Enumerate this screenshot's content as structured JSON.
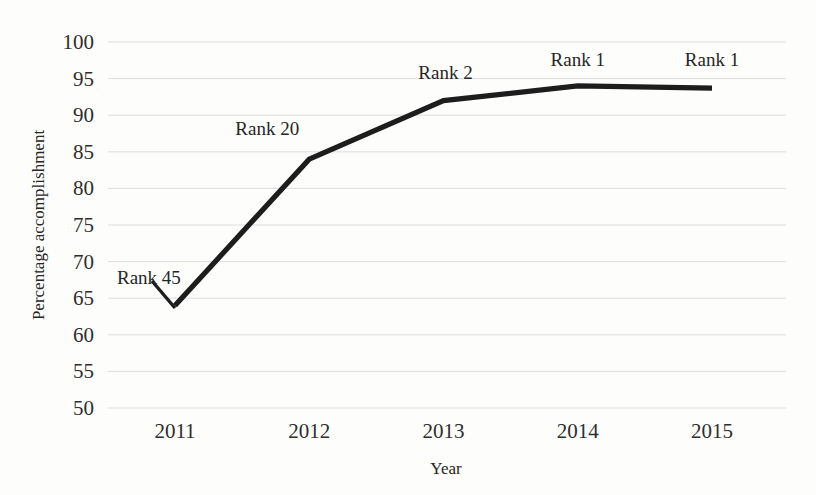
{
  "chart_data": {
    "type": "line",
    "title": "",
    "xlabel": "Year",
    "ylabel": "Percentage accomplishment",
    "categories": [
      "2011",
      "2012",
      "2013",
      "2014",
      "2015"
    ],
    "values": [
      64,
      84,
      92,
      94,
      93.7
    ],
    "series": [
      {
        "name": "Percentage accomplishment",
        "values": [
          64,
          84,
          92,
          94,
          93.7
        ],
        "color": "#1d1d1d"
      }
    ],
    "annotations": [
      {
        "label": "Rank 45",
        "category": "2011",
        "value": 64
      },
      {
        "label": "Rank 20",
        "category": "2012",
        "value": 84
      },
      {
        "label": "Rank 2",
        "category": "2013",
        "value": 92
      },
      {
        "label": "Rank 1",
        "category": "2014",
        "value": 94
      },
      {
        "label": "Rank 1",
        "category": "2015",
        "value": 93.7
      }
    ],
    "yticks": [
      "50",
      "55",
      "60",
      "65",
      "70",
      "75",
      "80",
      "85",
      "90",
      "95",
      "100"
    ],
    "xticks": [
      "2011",
      "2012",
      "2013",
      "2014",
      "2015"
    ],
    "ylim": [
      50,
      100
    ],
    "ytick_step": 5,
    "grid": true,
    "grid_axis": "y",
    "grid_color": "#dcdde0",
    "legend": "none",
    "background_color": "#fdfdfc",
    "text_color": "#2b2b2b"
  }
}
